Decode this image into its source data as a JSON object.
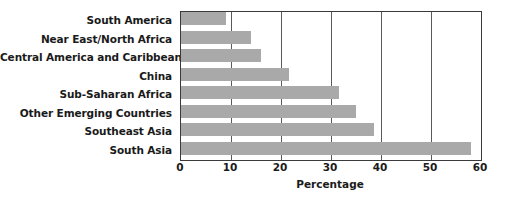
{
  "chart_data": {
    "type": "bar",
    "orientation": "horizontal",
    "title": "",
    "xlabel": "Percentage",
    "ylabel": "",
    "categories": [
      "South America",
      "Near East/North Africa",
      "Central America and Caribbean",
      "China",
      "Sub-Saharan Africa",
      "Other Emerging Countries",
      "Southeast Asia",
      "South Asia"
    ],
    "values": [
      9,
      14,
      16,
      21.5,
      31.5,
      35,
      38.5,
      58
    ],
    "xlim": [
      0,
      60
    ],
    "xticks": [
      0,
      10,
      20,
      30,
      40,
      50,
      60
    ],
    "xtick_labels": [
      "0",
      "10",
      "20",
      "30",
      "40",
      "50",
      "60"
    ],
    "grid": "vertical",
    "legend": "none",
    "bar_color": "#a9a9a9",
    "axis_color": "#3a3a3a",
    "text_color": "#1a1a1a",
    "background": "#ffffff"
  }
}
